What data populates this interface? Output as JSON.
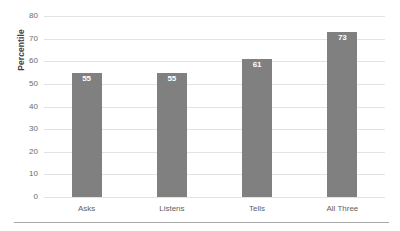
{
  "chart_data": {
    "type": "bar",
    "title": "",
    "subtitle": "",
    "xlabel": "",
    "ylabel": "Percentile",
    "categories": [
      "Asks",
      "Listens",
      "Tells",
      "All Three"
    ],
    "values": [
      55,
      55,
      61,
      73
    ],
    "data_labels": [
      "55",
      "55",
      "61",
      "73"
    ],
    "ylim": [
      0,
      80
    ],
    "ytick_step": 10,
    "yticks": [
      0,
      10,
      20,
      30,
      40,
      50,
      60,
      70,
      80
    ],
    "ytick_labels": [
      "0",
      "10",
      "20",
      "30",
      "40",
      "50",
      "60",
      "70",
      "80"
    ],
    "grid": "horizontal",
    "legend": "none",
    "series": [
      {
        "name": "Percentile",
        "values": [
          55,
          55,
          61,
          73
        ]
      }
    ],
    "colors": {
      "bar": "#808080",
      "gridline": "#e3e3e3",
      "data_label_text": "#ffffff",
      "axis_text": "#6b6b6b",
      "axis_title_text": "#3f3f3f",
      "bottom_rule": "#a8a8a8",
      "background": "#ffffff"
    }
  }
}
